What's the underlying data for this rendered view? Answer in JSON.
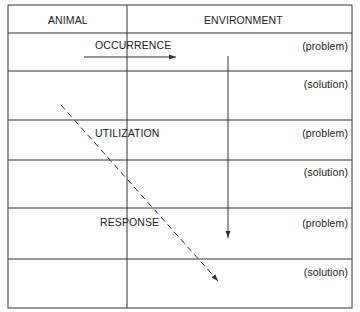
{
  "header": {
    "animal": "ANIMAL",
    "environment": "ENVIRONMENT"
  },
  "stages": [
    {
      "label": "OCCURRENCE",
      "problem": "(problem)",
      "solution": "(solution)"
    },
    {
      "label": "UTILIZATION",
      "problem": "(problem)",
      "solution": "(solution)"
    },
    {
      "label": "RESPONSE",
      "problem": "(problem)",
      "solution": "(solution)"
    }
  ],
  "colors": {
    "line": "#333333",
    "text": "#222222",
    "background": "#ffffff"
  }
}
